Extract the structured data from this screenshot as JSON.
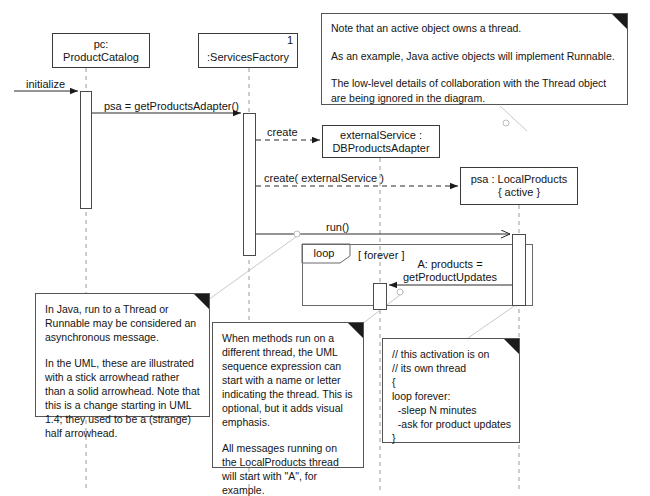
{
  "diagram": {
    "type": "uml-sequence-diagram",
    "background_color": "#ffffff",
    "line_color": "#3a3a3a",
    "note_anchor_color": "#cfcfcf"
  },
  "lifelines": [
    {
      "id": "product-catalog",
      "name_line1": "pc:",
      "name_line2": "ProductCatalog",
      "multiplicity": "",
      "x": 52,
      "y": 33,
      "w": 98,
      "h": 35,
      "lifeline_x": 86
    },
    {
      "id": "services-factory",
      "name_line1": "",
      "name_line2": ":ServicesFactory",
      "multiplicity": "1",
      "x": 198,
      "y": 33,
      "w": 100,
      "h": 35,
      "lifeline_x": 249
    },
    {
      "id": "external-service",
      "name_line1": "externalService :",
      "name_line2": "DBProductsAdapter",
      "multiplicity": "",
      "x": 322,
      "y": 125,
      "w": 118,
      "h": 33,
      "lifeline_x": 380
    },
    {
      "id": "psa-local-products",
      "name_line1": "psa : LocalProducts",
      "name_line2": "{ active }",
      "multiplicity": "",
      "x": 460,
      "y": 167,
      "w": 118,
      "h": 38,
      "lifeline_x": 519
    }
  ],
  "activations": [
    {
      "id": "act-product-catalog",
      "x": 80,
      "y": 91,
      "w": 12,
      "h": 118
    },
    {
      "id": "act-services-factory",
      "x": 243,
      "y": 113,
      "w": 13,
      "h": 143
    },
    {
      "id": "act-external-service",
      "x": 373,
      "y": 283,
      "w": 14,
      "h": 27
    },
    {
      "id": "act-local-products",
      "x": 512,
      "y": 234,
      "w": 14,
      "h": 72
    }
  ],
  "messages": [
    {
      "id": "msg-initialize",
      "label": "initialize",
      "label_x": 26,
      "label_y": 79,
      "arrow": "solid-filled"
    },
    {
      "id": "msg-get-products-adapter",
      "label": "psa = getProductsAdapter()",
      "label_x": 104,
      "label_y": 101,
      "arrow": "solid-filled"
    },
    {
      "id": "msg-create-external",
      "label": "create",
      "label_x": 268,
      "label_y": 126,
      "arrow": "dashed-filled"
    },
    {
      "id": "msg-create-local",
      "label": "create( externalService )",
      "label_x": 265,
      "label_y": 171,
      "arrow": "dashed-filled"
    },
    {
      "id": "msg-run",
      "label": "run()",
      "label_x": 326,
      "label_y": 221,
      "arrow": "solid-stick"
    },
    {
      "id": "msg-get-product-updates",
      "label_line1": "A: products =",
      "label_line2": "getProductUpdates",
      "label_x": 404,
      "label_y": 258,
      "arrow": "solid-filled"
    }
  ],
  "fragment": {
    "id": "loop-fragment",
    "operator": "loop",
    "guard": "[ forever ]",
    "x": 302,
    "y": 244,
    "w": 231,
    "h": 62,
    "tab_w": 48,
    "tab_h": 19,
    "guard_x": 358,
    "guard_y": 249
  },
  "notes": [
    {
      "id": "note-active-object",
      "x": 321,
      "y": 13,
      "w": 307,
      "h": 92,
      "paragraphs": [
        "Note that an active object owns a thread.",
        "As an example, Java active objects will implement Runnable.",
        "The low-level details of collaboration with the Thread object are being ignored in the diagram."
      ],
      "anchor": {
        "from_x": 498,
        "from_y": 105,
        "to_x": 527,
        "to_y": 130,
        "circle_x": 506,
        "circle_y": 123
      }
    },
    {
      "id": "note-async-arrowhead",
      "x": 35,
      "y": 293,
      "w": 175,
      "h": 124,
      "paragraphs": [
        "In Java, run to a Thread or Runnable may be considered an asynchronous message.",
        "In the UML, these are illustrated with a stick arrowhead rather than a solid arrowhead. Note that this is a change starting in UML 1.4; they used to be a (strange) half arrowhead."
      ],
      "anchor": {
        "from_x": 210,
        "from_y": 300,
        "to_x": 302,
        "to_y": 232,
        "circle_x": 297,
        "circle_y": 233
      }
    },
    {
      "id": "note-thread-naming",
      "x": 212,
      "y": 322,
      "w": 152,
      "h": 146,
      "paragraphs": [
        "When methods run on a different thread, the UML sequence expression can start with a name or letter indicating the thread. This is optional, but it adds visual emphasis.",
        "All messages running on the LocalProducts thread will start with \"A\", for example."
      ],
      "anchor": {
        "from_x": 364,
        "from_y": 322,
        "to_x": 405,
        "to_y": 290,
        "circle_x": 400,
        "circle_y": 292
      }
    },
    {
      "id": "note-activation-code",
      "x": 382,
      "y": 338,
      "w": 138,
      "h": 105,
      "code_lines": [
        "// this activation is on",
        "// its own thread",
        "{",
        "loop forever:",
        "  -sleep N minutes",
        "  -ask for product updates",
        "}"
      ],
      "anchor": {
        "from_x": 470,
        "from_y": 338,
        "to_x": 520,
        "to_y": 300,
        "circle_x": 515,
        "circle_y": 303
      }
    }
  ]
}
